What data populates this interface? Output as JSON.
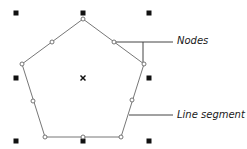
{
  "diagram": {
    "type": "vector-shape-anatomy",
    "shape": "pentagon",
    "labels": {
      "nodes": "Nodes",
      "line_segment": "Line segment"
    },
    "colors": {
      "outline": "#777777",
      "node_fill": "#ffffff",
      "node_stroke": "#666666",
      "handle": "#111111",
      "callout": "#444444",
      "center_mark": "#111111"
    },
    "vertices": [
      [
        83,
        19
      ],
      [
        144,
        64
      ],
      [
        121,
        137
      ],
      [
        45,
        137
      ],
      [
        22,
        64
      ]
    ],
    "nodes": [
      [
        83,
        19
      ],
      [
        114,
        42
      ],
      [
        144,
        64
      ],
      [
        132,
        100
      ],
      [
        121,
        137
      ],
      [
        83,
        137
      ],
      [
        45,
        137
      ],
      [
        33,
        101
      ],
      [
        22,
        64
      ],
      [
        52,
        42
      ]
    ],
    "handles": [
      [
        16,
        13
      ],
      [
        83,
        13
      ],
      [
        149,
        13
      ],
      [
        16,
        78
      ],
      [
        149,
        78
      ],
      [
        16,
        141
      ],
      [
        83,
        141
      ],
      [
        149,
        141
      ]
    ],
    "center": [
      83,
      78
    ]
  }
}
